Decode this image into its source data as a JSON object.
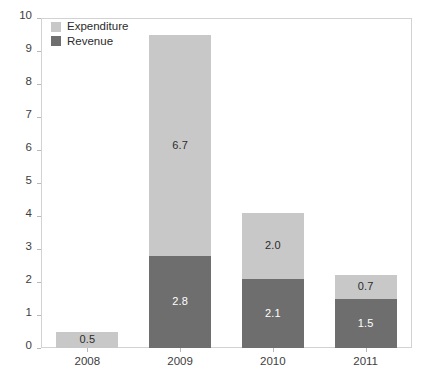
{
  "chart_data": {
    "type": "bar",
    "stacked": true,
    "title": "",
    "subtitle": "",
    "xlabel": "",
    "ylabel": "",
    "categories": [
      "2008",
      "2009",
      "2010",
      "2011"
    ],
    "series": [
      {
        "name": "Revenue",
        "color": "#6e6e6e",
        "values": [
          0,
          2.8,
          2.1,
          1.5
        ],
        "labels": [
          "",
          "2.8",
          "2.1",
          "1.5"
        ]
      },
      {
        "name": "Expenditure",
        "color": "#c8c8c8",
        "values": [
          0.5,
          6.7,
          2.0,
          0.7
        ],
        "labels": [
          "0.5",
          "6.7",
          "2.0",
          "0.7"
        ]
      }
    ],
    "totals": [
      0.5,
      9.5,
      4.1,
      2.2
    ],
    "ylim": [
      0,
      10
    ],
    "yticks": [
      0,
      1,
      2,
      3,
      4,
      5,
      6,
      7,
      8,
      9,
      10
    ],
    "ytick_labels": [
      "0",
      "1",
      "2",
      "3",
      "4",
      "5",
      "6",
      "7",
      "8",
      "9",
      "10"
    ],
    "grid": false,
    "legend_position": "top-left",
    "legend_entries": [
      {
        "label": "Expenditure",
        "color": "#c8c8c8"
      },
      {
        "label": "Revenue",
        "color": "#6e6e6e"
      }
    ]
  },
  "colors": {
    "expenditure": "#c8c8c8",
    "revenue": "#6e6e6e",
    "axis_text": "#3d3d3d",
    "frame": "#d2d2d2",
    "tick": "#b8b8b8",
    "label_on_light": "#2b2b2b",
    "label_on_dark": "#ffffff",
    "background": "#ffffff"
  }
}
